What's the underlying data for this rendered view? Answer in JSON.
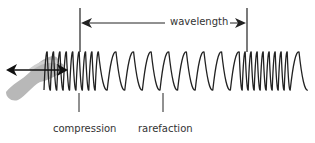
{
  "diagram": {
    "labels": {
      "wavelength": "wavelength",
      "compression": "compression",
      "rarefaction": "rarefaction"
    },
    "elements": {
      "hand": "hand pushing spring back and forth",
      "motion_arrow": "double-headed horizontal arrow",
      "spring": "coiled spring with compressions and rarefactions"
    },
    "colors": {
      "spring": "#222222",
      "hand": "#b5b5b5",
      "text": "#333333"
    }
  }
}
